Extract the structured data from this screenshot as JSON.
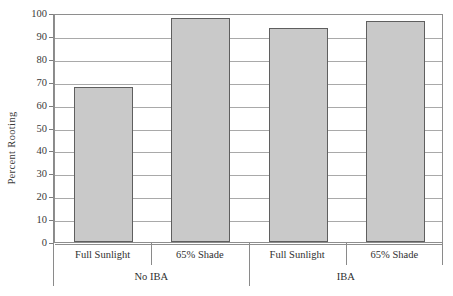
{
  "chart_data": {
    "type": "bar",
    "title": "",
    "subtitle": "",
    "xlabel": "",
    "ylabel": "Percent Rooting",
    "ylim": [
      0,
      100
    ],
    "ytick_labels": [
      "0",
      "10",
      "20",
      "30",
      "40",
      "50",
      "60",
      "70",
      "80",
      "90",
      "100"
    ],
    "ytick_values": [
      0,
      10,
      20,
      30,
      40,
      50,
      60,
      70,
      80,
      90,
      100
    ],
    "grid": true,
    "grid_axis": "y",
    "legend": false,
    "legend_position": "none",
    "categories": [
      "Full Sunlight",
      "65% Shade",
      "Full Sunlight",
      "65% Shade"
    ],
    "values": [
      67.5,
      98,
      93.5,
      96.5
    ],
    "groups": [
      {
        "label": "No IBA",
        "categories": [
          "Full Sunlight",
          "65% Shade"
        ],
        "values": [
          67.5,
          98
        ]
      },
      {
        "label": "IBA",
        "categories": [
          "Full Sunlight",
          "65% Shade"
        ],
        "values": [
          93.5,
          96.5
        ]
      }
    ],
    "bar_fill_color": "#c9c9c9",
    "bar_edge_color": "#5f5f5f",
    "gridline_color": "#a9a9a9",
    "frame_color": "#8e8e8e"
  },
  "axis": {
    "y_title": "Percent Rooting"
  },
  "ticks": {
    "y": [
      {
        "label": "100",
        "value": 100
      },
      {
        "label": "90",
        "value": 90
      },
      {
        "label": "80",
        "value": 80
      },
      {
        "label": "70",
        "value": 70
      },
      {
        "label": "60",
        "value": 60
      },
      {
        "label": "50",
        "value": 50
      },
      {
        "label": "40",
        "value": 40
      },
      {
        "label": "30",
        "value": 30
      },
      {
        "label": "20",
        "value": 20
      },
      {
        "label": "10",
        "value": 10
      },
      {
        "label": "0",
        "value": 0
      }
    ]
  },
  "x_categories": [
    {
      "label": "Full Sunlight"
    },
    {
      "label": "65% Shade"
    },
    {
      "label": "Full Sunlight"
    },
    {
      "label": "65% Shade"
    }
  ],
  "x_groups": [
    {
      "label": "No IBA"
    },
    {
      "label": "IBA"
    }
  ]
}
